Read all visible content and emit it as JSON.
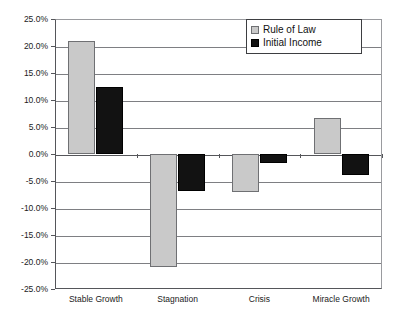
{
  "chart_data": {
    "type": "bar",
    "title": "",
    "xlabel": "",
    "ylabel": "",
    "ylim": [
      -25,
      25
    ],
    "ytick_step": 5,
    "grid": true,
    "legend_position": "top-right",
    "categories": [
      "Stable Growth",
      "Stagnation",
      "Crisis",
      "Miracle Growth"
    ],
    "ytick_labels": [
      "25.0%",
      "20.0%",
      "15.0%",
      "10.0%",
      "5.0%",
      "0.0%",
      "-5.0%",
      "-10.0%",
      "-15.0%",
      "-20.0%",
      "-25.0%"
    ],
    "ytick_values": [
      25,
      20,
      15,
      10,
      5,
      0,
      -5,
      -10,
      -15,
      -20,
      -25
    ],
    "series": [
      {
        "name": "Rule of Law",
        "color": "#c9c9c9",
        "values": [
          21.0,
          -21.0,
          -7.0,
          6.7
        ]
      },
      {
        "name": "Initial Income",
        "color": "#121212",
        "values": [
          12.4,
          -6.9,
          -1.7,
          -3.9
        ]
      }
    ]
  },
  "legend": {
    "items": [
      {
        "label": "Rule of Law",
        "swatch": "light-gray-square"
      },
      {
        "label": "Initial Income",
        "swatch": "black-square"
      }
    ]
  }
}
